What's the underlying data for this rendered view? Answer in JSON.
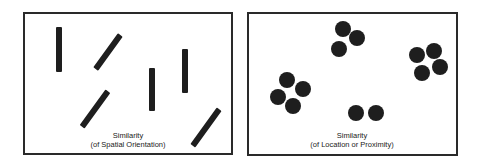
{
  "figure": {
    "panels": [
      {
        "id": "orientation",
        "caption_line1": "Similarity",
        "caption_line2": "(of Spatial Orientation)",
        "shape": "bar",
        "elements": [
          {
            "cx": 59,
            "cy": 49.5,
            "length": 45,
            "angle": 0
          },
          {
            "cx": 107.5,
            "cy": 52,
            "length": 42,
            "angle": 36
          },
          {
            "cx": 152,
            "cy": 89.5,
            "length": 43,
            "angle": 0
          },
          {
            "cx": 185,
            "cy": 71,
            "length": 44,
            "angle": 0
          },
          {
            "cx": 95,
            "cy": 109,
            "length": 44,
            "angle": 36
          },
          {
            "cx": 205.5,
            "cy": 127.5,
            "length": 45,
            "angle": 36
          }
        ]
      },
      {
        "id": "proximity",
        "caption_line1": "Similarity",
        "caption_line2": "(of Location or Proximity)",
        "shape": "circle",
        "groups": [
          {
            "name": "top",
            "points": [
              [
                343,
                29
              ],
              [
                357,
                38
              ],
              [
                339,
                49
              ]
            ]
          },
          {
            "name": "left",
            "points": [
              [
                287,
                80
              ],
              [
                303,
                89
              ],
              [
                278,
                97
              ],
              [
                293,
                106
              ]
            ]
          },
          {
            "name": "right",
            "points": [
              [
                417,
                55
              ],
              [
                434,
                51
              ],
              [
                440,
                67
              ],
              [
                422,
                73
              ]
            ]
          },
          {
            "name": "bottom",
            "points": [
              [
                356,
                113
              ],
              [
                376,
                113
              ]
            ]
          }
        ]
      }
    ],
    "colors": {
      "ink": "#1e1e1e",
      "border": "#2a2a2a",
      "background": "#ffffff"
    }
  }
}
